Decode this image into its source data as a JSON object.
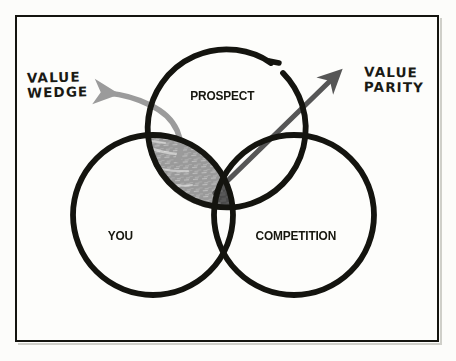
{
  "diagram": {
    "background_color": "#fcfcfa",
    "frame_color": "#14140f",
    "circle_stroke_color": "#14140f",
    "circles": [
      {
        "id": "prospect",
        "label": "PROSPECT",
        "cx": 225,
        "cy": 131,
        "r": 79
      },
      {
        "id": "you",
        "label": "YOU",
        "cx": 153,
        "cy": 215,
        "r": 80
      },
      {
        "id": "competition",
        "label": "COMPETITION",
        "cx": 294,
        "cy": 215,
        "r": 80
      }
    ],
    "regions": [
      {
        "id": "value-wedge",
        "name": "Value Wedge",
        "description": "YOU and PROSPECT overlap, excluding COMPETITION",
        "fill_color": "#9a9a9a"
      },
      {
        "id": "value-parity",
        "name": "Value Parity",
        "description": "YOU, PROSPECT and COMPETITION all overlap",
        "fill_color": "#4a4a4a"
      }
    ],
    "callouts": [
      {
        "id": "value-wedge-callout",
        "text": "VALUE\nWEDGE",
        "arrow_color": "#9b9b9b",
        "arrow_style": "curved",
        "points_to": "value-wedge"
      },
      {
        "id": "value-parity-callout",
        "text": "VALUE\nPARITY",
        "arrow_color": "#565656",
        "arrow_style": "straight",
        "points_to": "value-parity"
      }
    ]
  }
}
